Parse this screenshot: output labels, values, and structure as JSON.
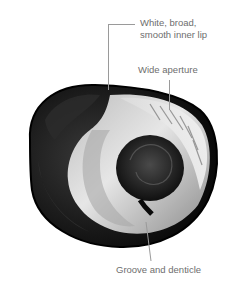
{
  "figure": {
    "annotations": [
      {
        "id": "lip",
        "text_lines": [
          "White, broad,",
          "smooth inner lip"
        ]
      },
      {
        "id": "aperture",
        "text": "Wide aperture"
      },
      {
        "id": "groove",
        "text": "Groove and denticle"
      }
    ]
  },
  "colors": {
    "background": "#ffffff",
    "label_text": "#6e6e6e",
    "leader_line": "#9a9a9a",
    "shell_dark": "#111111",
    "shell_light": "#d9d9d9"
  }
}
